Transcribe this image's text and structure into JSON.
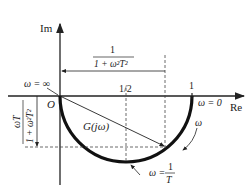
{
  "diagram": {
    "type": "nyquist-plot",
    "axes": {
      "imaginary_label": "Im",
      "real_label": "Re",
      "origin_label": "O"
    },
    "ticks": {
      "half": "1/2",
      "one": "1"
    },
    "curve": {
      "label": "G(jω)",
      "omega_label": "ω"
    },
    "annotations": {
      "omega_infinity": "ω = ∞",
      "omega_zero": "ω = 0",
      "omega_corner_prefix": "ω =",
      "omega_corner_num": "1",
      "omega_corner_den": "T",
      "real_part_num": "1",
      "real_part_den": "1 + ω²T²",
      "imag_part_num": "ωT",
      "imag_part_den": "1 + ω²T²"
    },
    "colors": {
      "line": "#222222",
      "background": "#ffffff"
    }
  }
}
